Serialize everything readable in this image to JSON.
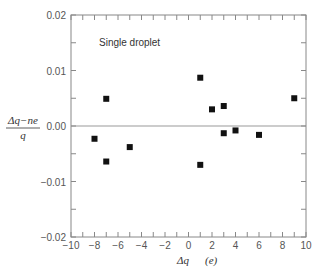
{
  "chart_data": {
    "type": "scatter",
    "title": "",
    "annotation": "Single droplet",
    "xlabel": "Δq",
    "xlabel_unit": "(e)",
    "ylabel_numerator": "Δq−ne",
    "ylabel_denominator": "q",
    "xlim": [
      -10,
      10
    ],
    "ylim": [
      -0.02,
      0.02
    ],
    "xticks": [
      -10,
      -8,
      -6,
      -4,
      -2,
      0,
      2,
      4,
      6,
      8,
      10
    ],
    "xtick_labels": [
      "−10",
      "−8",
      "−6",
      "−4",
      "−2",
      "0",
      "2",
      "4",
      "6",
      "8",
      "10"
    ],
    "x_minor_step": 1,
    "yticks": [
      -0.02,
      -0.01,
      0.0,
      0.01,
      0.02
    ],
    "ytick_labels": [
      "−0.02",
      "−0.01",
      "0.00",
      "0.01",
      "0.02"
    ],
    "y_minor_step": 0.005,
    "zero_line": true,
    "grid": false,
    "marker": "square",
    "series": [
      {
        "name": "Single droplet",
        "points": [
          {
            "x": -8,
            "y": -0.0023
          },
          {
            "x": -7,
            "y": 0.0049
          },
          {
            "x": -7,
            "y": -0.0064
          },
          {
            "x": -5,
            "y": -0.0038
          },
          {
            "x": 1,
            "y": 0.0087
          },
          {
            "x": 1,
            "y": -0.007
          },
          {
            "x": 2,
            "y": 0.003
          },
          {
            "x": 3,
            "y": 0.0036
          },
          {
            "x": 3,
            "y": -0.0013
          },
          {
            "x": 4,
            "y": -0.0008
          },
          {
            "x": 6,
            "y": -0.0016
          },
          {
            "x": 9,
            "y": 0.005
          }
        ]
      }
    ]
  }
}
